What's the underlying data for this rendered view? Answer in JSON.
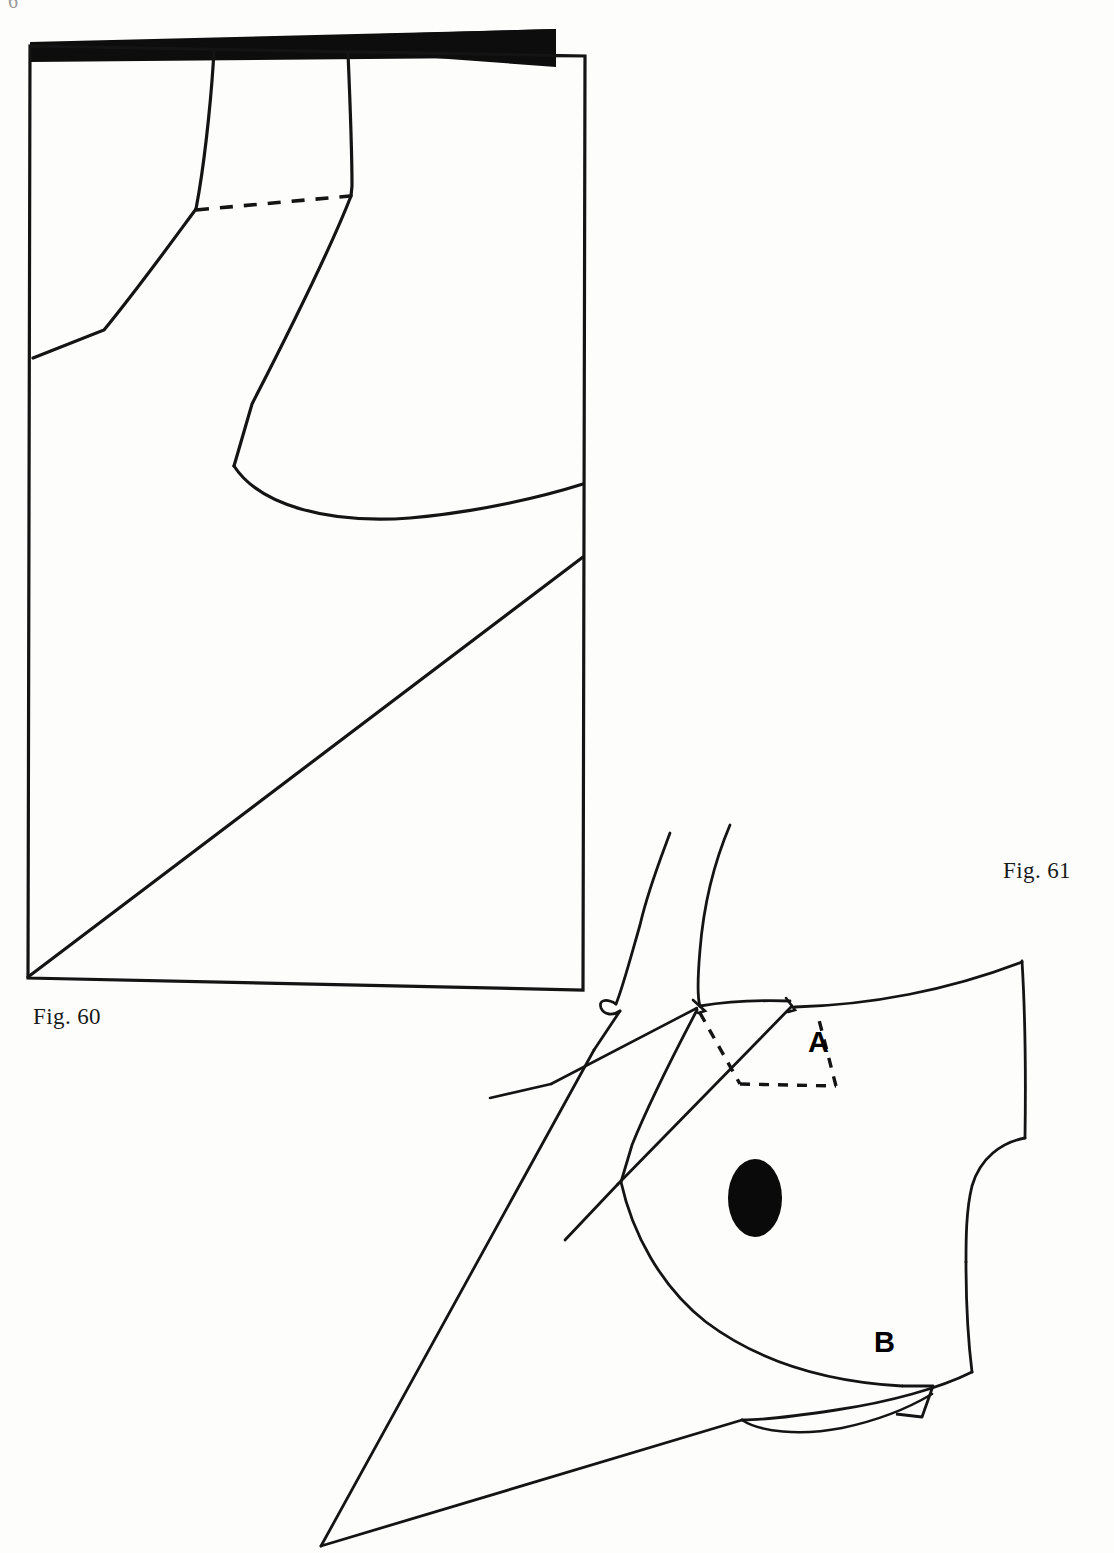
{
  "page": {
    "background_color": "#fdfdfb",
    "ink_color": "#111111",
    "width": 1114,
    "height": 1553,
    "folio_fragment": "6"
  },
  "figures": [
    {
      "id": "fig-60",
      "caption": "Fig. 60",
      "description": "Rectangular pattern layout sheet with folded/shaded top edge, two vertical construction lines, a dashed dart line and a long diagonal bias line running corner to corner.",
      "elements": {
        "shaded_fold_bar": "solid black wedge along the top edge",
        "dashed_line": "dart closing line between the two vertical seams",
        "diagonal": "bias line from lower-left corner to right edge"
      }
    },
    {
      "id": "fig-61",
      "caption": "Fig. 61",
      "description": "Bodice / sleeve pattern piece with neck and shoulder curves, a dashed dart labelled A, an armhole curve, a solid filled oval marker and a small notch labelled B at the lower hem.",
      "labels": [
        {
          "name": "A",
          "text": "A",
          "meaning": "dart-label-a"
        },
        {
          "name": "B",
          "text": "B",
          "meaning": "notch-label-b"
        }
      ],
      "elements": {
        "dart_dashed_outline": "dashed trapezoid at the shoulder marked A",
        "filled_oval": "solid black ellipse bust point marker",
        "notch": "small wedge notch at hem marked B"
      }
    }
  ],
  "colors": {
    "ink": "#111111",
    "fill_black": "#0a0a0a",
    "paper": "#fdfdfb",
    "caption": "#1a1a1a"
  }
}
